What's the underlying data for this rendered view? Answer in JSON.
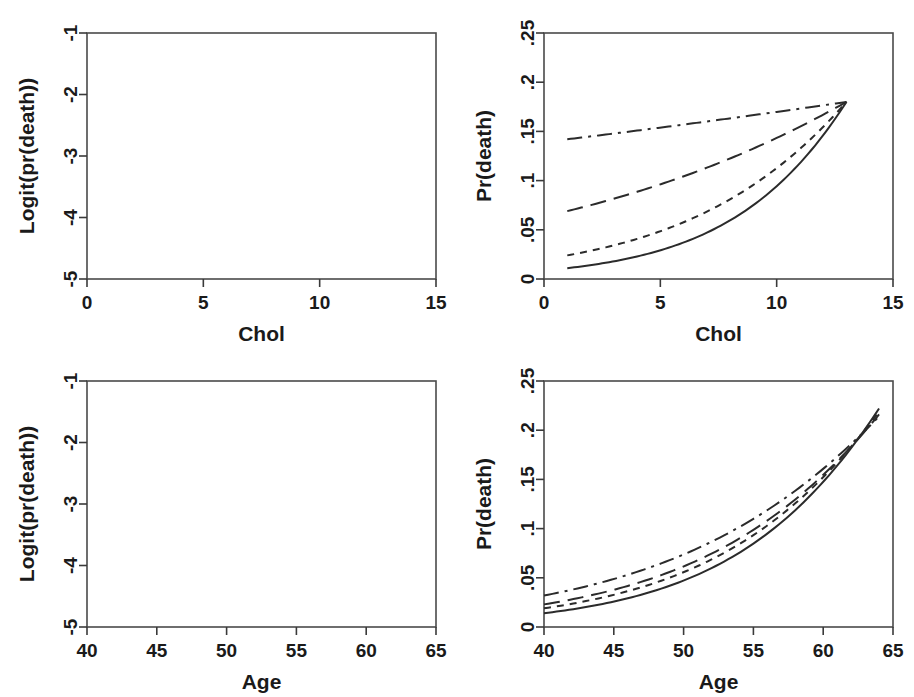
{
  "figure": {
    "background": "#ffffff",
    "line_color": "#2b2b2b",
    "panel_count": 4
  },
  "chart_data": [
    {
      "id": "top-left",
      "type": "line",
      "title": "",
      "xlabel": "Chol",
      "ylabel": "Logit(pr(death))",
      "xlim": [
        0,
        15
      ],
      "ylim": [
        -5,
        -1
      ],
      "xticks": [
        0,
        5,
        10,
        15
      ],
      "xticklabels": [
        "0",
        "5",
        "10",
        "15"
      ],
      "yticks": [
        -1,
        -2,
        -3,
        -4,
        -5
      ],
      "yticklabels": [
        "-1",
        "-2",
        "-3",
        "-4",
        "-5"
      ],
      "grid": false,
      "legend": "none",
      "x": [
        1,
        13
      ],
      "series": [
        {
          "name": "curve-1",
          "style": "dashdot",
          "values": [
            -1.8,
            -1.52
          ]
        },
        {
          "name": "curve-2",
          "style": "longdash",
          "values": [
            -2.6,
            -1.52
          ]
        },
        {
          "name": "curve-3",
          "style": "shortdash",
          "values": [
            -3.72,
            -1.52
          ]
        },
        {
          "name": "curve-4",
          "style": "solid",
          "values": [
            -4.5,
            -1.52
          ]
        }
      ]
    },
    {
      "id": "top-right",
      "type": "line",
      "title": "",
      "xlabel": "Chol",
      "ylabel": "Pr(death)",
      "xlim": [
        0,
        15
      ],
      "ylim": [
        0,
        0.25
      ],
      "xticks": [
        0,
        5,
        10,
        15
      ],
      "xticklabels": [
        "0",
        "5",
        "10",
        "15"
      ],
      "yticks": [
        0,
        0.05,
        0.1,
        0.15,
        0.2,
        0.25
      ],
      "yticklabels": [
        "0",
        ".05",
        ".1",
        ".15",
        ".2",
        ".25"
      ],
      "grid": false,
      "legend": "none",
      "x": [
        1,
        13
      ],
      "series": [
        {
          "name": "curve-1",
          "style": "dashdot",
          "values": [
            0.142,
            0.18
          ]
        },
        {
          "name": "curve-2",
          "style": "longdash",
          "values": [
            0.069,
            0.18
          ]
        },
        {
          "name": "curve-3",
          "style": "shortdash",
          "values": [
            0.024,
            0.18
          ]
        },
        {
          "name": "curve-4",
          "style": "solid",
          "values": [
            0.011,
            0.18
          ]
        }
      ]
    },
    {
      "id": "bottom-left",
      "type": "line",
      "title": "",
      "xlabel": "Age",
      "ylabel": "Logit(pr(death))",
      "xlim": [
        40,
        65
      ],
      "ylim": [
        -5,
        -1
      ],
      "xticks": [
        40,
        45,
        50,
        55,
        60,
        65
      ],
      "xticklabels": [
        "40",
        "45",
        "50",
        "55",
        "60",
        "65"
      ],
      "yticks": [
        -1,
        -2,
        -3,
        -4,
        -5
      ],
      "yticklabels": [
        "-1",
        "-2",
        "-3",
        "-4",
        "-5"
      ],
      "grid": false,
      "legend": "none",
      "x": [
        40,
        64
      ],
      "series": [
        {
          "name": "curve-1",
          "style": "dashdot",
          "values": [
            -3.42,
            -1.3
          ]
        },
        {
          "name": "curve-2",
          "style": "longdash",
          "values": [
            -3.76,
            -1.31
          ]
        },
        {
          "name": "curve-3",
          "style": "shortdash",
          "values": [
            -3.96,
            -1.32
          ]
        },
        {
          "name": "curve-4",
          "style": "solid",
          "values": [
            -4.28,
            -1.33
          ]
        }
      ]
    },
    {
      "id": "bottom-right",
      "type": "line",
      "title": "",
      "xlabel": "Age",
      "ylabel": "Pr(death)",
      "xlim": [
        40,
        65
      ],
      "ylim": [
        0,
        0.25
      ],
      "xticks": [
        40,
        45,
        50,
        55,
        60,
        65
      ],
      "xticklabels": [
        "40",
        "45",
        "50",
        "55",
        "60",
        "65"
      ],
      "yticks": [
        0,
        0.05,
        0.1,
        0.15,
        0.2,
        0.25
      ],
      "yticklabels": [
        "0",
        ".05",
        ".1",
        ".15",
        ".2",
        ".25"
      ],
      "grid": false,
      "legend": "none",
      "x": [
        40,
        64
      ],
      "series": [
        {
          "name": "curve-1",
          "style": "dashdot",
          "values": [
            0.032,
            0.214
          ]
        },
        {
          "name": "curve-2",
          "style": "longdash",
          "values": [
            0.023,
            0.216
          ]
        },
        {
          "name": "curve-3",
          "style": "shortdash",
          "values": [
            0.019,
            0.219
          ]
        },
        {
          "name": "curve-4",
          "style": "solid",
          "values": [
            0.014,
            0.222
          ]
        }
      ]
    }
  ]
}
